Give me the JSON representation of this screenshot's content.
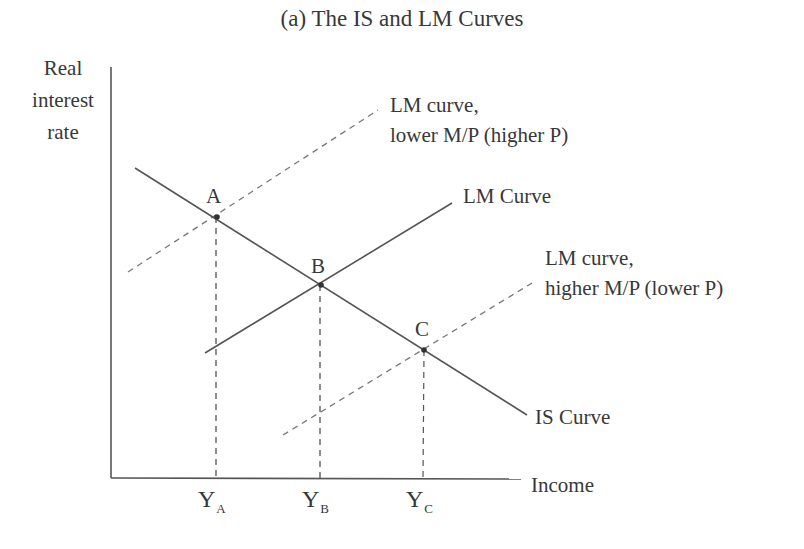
{
  "title": "(a) The IS and LM Curves",
  "axes": {
    "y_label_lines": [
      "Real",
      "interest",
      "rate"
    ],
    "x_label": "Income"
  },
  "curves": {
    "is": "IS Curve",
    "lm": "LM Curve",
    "lm_upper": [
      "LM curve,",
      "lower M/P (higher P)"
    ],
    "lm_lower": [
      "LM curve,",
      "higher M/P (lower P)"
    ]
  },
  "points": {
    "a": "A",
    "b": "B",
    "c": "C"
  },
  "ticks": [
    {
      "main": "Y",
      "sub": "A"
    },
    {
      "main": "Y",
      "sub": "B"
    },
    {
      "main": "Y",
      "sub": "C"
    }
  ],
  "colors": {
    "line": "#555555",
    "text": "#383838"
  }
}
